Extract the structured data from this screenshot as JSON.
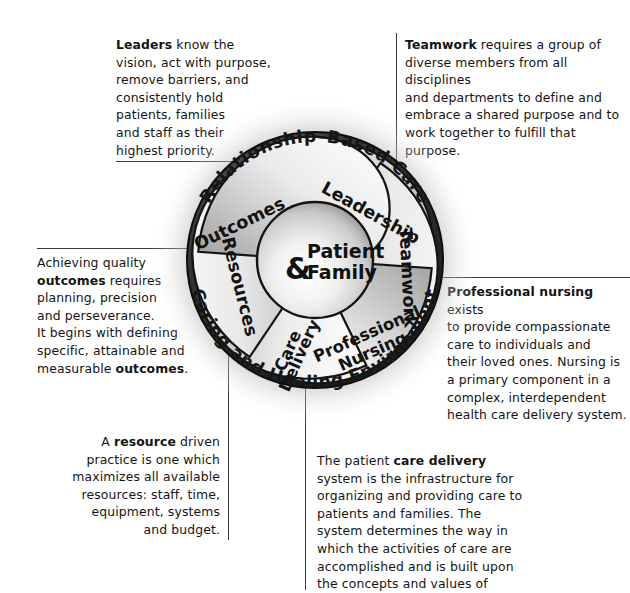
{
  "diagram": {
    "name": "relationship-based-care-wheel",
    "outer_ring_top_label": "Relationship–Based Care",
    "outer_ring_bottom_label": "Caring and Healing Environment",
    "hub": {
      "ampersand": "&",
      "line1": "Patient",
      "line2": "Family"
    },
    "petals": [
      {
        "id": "leadership",
        "label": "Leadership"
      },
      {
        "id": "teamwork",
        "label": "Teamwork"
      },
      {
        "id": "professional-nursing",
        "label_line1": "Professional",
        "label_line2": "Nursing"
      },
      {
        "id": "care-delivery",
        "label_line1": "Care",
        "label_line2": "Delivery"
      },
      {
        "id": "resources",
        "label": "Resources"
      },
      {
        "id": "outcomes",
        "label": "Outcomes"
      }
    ]
  },
  "callouts": {
    "leaders": {
      "keyword": "Leaders",
      "lines": [
        " know the",
        "vision, act with purpose,",
        "remove barriers, and",
        "consistently hold",
        "patients, families",
        "and staff as their",
        "highest priority."
      ]
    },
    "teamwork": {
      "keyword": "Teamwork",
      "lines": [
        " requires a group of",
        "diverse members from all disciplines",
        "and departments to define and",
        "embrace a shared purpose and to",
        "work together to fulfill that purpose."
      ]
    },
    "outcomes": {
      "line1_plain": "Achieving quality",
      "keyword": "outcomes",
      "line2_rest": " requires",
      "lines_mid": [
        "planning, precision",
        "and perseverance.",
        "It begins with defining",
        "specific, attainable and"
      ],
      "last_prefix": "measurable ",
      "last_keyword": "outcomes",
      "last_suffix": "."
    },
    "professional_nursing": {
      "keyword": "Professional nursing",
      "lines": [
        " exists",
        "to provide compassionate",
        "care to individuals and",
        "their loved ones. Nursing is",
        "a primary component in a",
        "complex, interdependent",
        "health care delivery system."
      ]
    },
    "resource": {
      "prefix": "A ",
      "keyword": "resource",
      "suffix": " driven",
      "lines": [
        "practice is one which",
        "maximizes all available",
        "resources: staff, time,",
        "equipment, systems",
        "and budget."
      ]
    },
    "care_delivery": {
      "prefix": "The patient ",
      "keyword": "care delivery",
      "lines": [
        "system is the infrastructure for",
        "organizing and providing care to",
        "patients and families. The",
        "system determines the way in",
        "which the activities of care are",
        "accomplished and is built upon",
        "the concepts and values of"
      ]
    }
  },
  "colors": {
    "ink": "#141414",
    "rule": "#3a3a3a",
    "ring_dark": "#2b2b2b",
    "petal_light": "#f2f2f2",
    "background": "#ffffff"
  }
}
